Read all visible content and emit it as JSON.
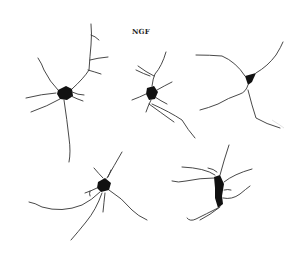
{
  "figure": {
    "label": "NGF",
    "neuron_count": 5,
    "colors": {
      "ink": "#111111",
      "background": "#ffffff"
    }
  }
}
